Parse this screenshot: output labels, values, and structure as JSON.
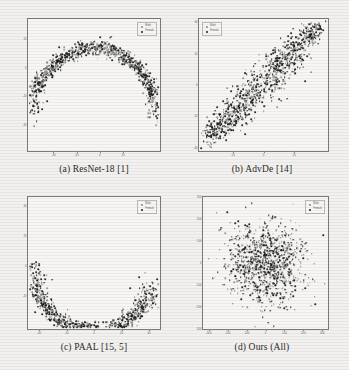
{
  "figure": {
    "background": "#f2f1ef",
    "legend": {
      "male_label": "Male",
      "female_label": "Female"
    },
    "colors": {
      "male": "#8d8d8d",
      "female": "#1c1c1c",
      "axis": "#7a7a78"
    }
  },
  "chart_data": [
    {
      "id": "a",
      "type": "scatter",
      "title": "(a)  ResNet-18 [1]",
      "caption": "(a)  ResNet-18 [1]",
      "xlabel": "",
      "ylabel": "",
      "legend_position": "top-right",
      "xlim": [
        -62,
        52
      ],
      "ylim": [
        -58,
        34
      ],
      "xticks": [
        -40,
        -20,
        0,
        20
      ],
      "yticks": [
        20,
        0,
        -20,
        -40
      ],
      "shape": "inverted-arch",
      "series": [
        {
          "name": "Male",
          "color": "#8d8d8d",
          "n": 420
        },
        {
          "name": "Female",
          "color": "#1c1c1c",
          "n": 520
        }
      ]
    },
    {
      "id": "b",
      "type": "scatter",
      "title": "(b)  AdvDe [14]",
      "caption": "(b)  AdvDe [14]",
      "xlabel": "",
      "ylabel": "",
      "legend_position": "top-left",
      "xlim": [
        -42,
        42
      ],
      "ylim": [
        -42,
        42
      ],
      "xticks": [
        -20,
        0,
        20
      ],
      "yticks": [
        40,
        20,
        0,
        -20,
        -40
      ],
      "shape": "diagonal-elongated",
      "series": [
        {
          "name": "Male",
          "color": "#8d8d8d",
          "n": 430
        },
        {
          "name": "Female",
          "color": "#1c1c1c",
          "n": 540
        }
      ]
    },
    {
      "id": "c",
      "type": "scatter",
      "title": "(c)  PAAL [15, 5]",
      "caption": "(c)  PAAL [15, 5]",
      "xlabel": "",
      "ylabel": "",
      "legend_position": "top-right",
      "xlim": [
        -48,
        48
      ],
      "ylim": [
        -42,
        46
      ],
      "xticks": [
        -40,
        -20,
        0,
        20,
        40
      ],
      "yticks": [
        40,
        20,
        0,
        -20
      ],
      "shape": "crescent-u",
      "series": [
        {
          "name": "Male",
          "color": "#8d8d8d",
          "n": 400
        },
        {
          "name": "Female",
          "color": "#1c1c1c",
          "n": 500
        }
      ]
    },
    {
      "id": "d",
      "type": "scatter",
      "title": "(d)  Ours (All)",
      "caption": "(d)  Ours (All)",
      "xlabel": "",
      "ylabel": "",
      "legend_position": "top-right",
      "xlim": [
        -330,
        330
      ],
      "ylim": [
        -300,
        300
      ],
      "xticks": [
        -300,
        -200,
        -100,
        0,
        100,
        200,
        300
      ],
      "yticks": [
        300,
        200,
        100,
        0,
        -100,
        -200,
        -300
      ],
      "shape": "isotropic-gaussian",
      "series": [
        {
          "name": "Male",
          "color": "#8d8d8d",
          "n": 380
        },
        {
          "name": "Female",
          "color": "#1c1c1c",
          "n": 620
        }
      ]
    }
  ]
}
